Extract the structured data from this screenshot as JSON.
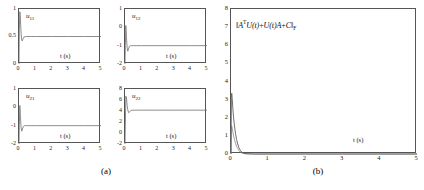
{
  "figure": {
    "captions": [
      {
        "id": "caption-a",
        "text": "(a)"
      },
      {
        "id": "caption-b",
        "text": "(b)"
      }
    ]
  },
  "chart_data": [
    {
      "id": "u11",
      "type": "line",
      "title": "u11",
      "series_label": "u",
      "series_sub": "11",
      "xlabel": "t (s)",
      "ylabel": "",
      "xlim": [
        0,
        5
      ],
      "ylim": [
        0,
        1
      ],
      "xticks": [
        0,
        1,
        2,
        3,
        4,
        5
      ],
      "xticklabels": [
        "0",
        "1",
        "2",
        "3",
        "4",
        "5"
      ],
      "yticks": [
        0,
        0.5,
        1
      ],
      "yticklabels": [
        "0",
        "0.5",
        "1"
      ],
      "grid": false,
      "steady_state": 0.5,
      "x": [
        0,
        0.02,
        0.05,
        0.08,
        0.1,
        0.13,
        0.16,
        0.2,
        0.25,
        0.3,
        0.4,
        0.5,
        0.7,
        1.0,
        2.0,
        3.0,
        4.0,
        5.0
      ],
      "y": [
        0,
        0.62,
        0.95,
        0.88,
        0.72,
        0.55,
        0.44,
        0.42,
        0.46,
        0.49,
        0.5,
        0.5,
        0.5,
        0.5,
        0.5,
        0.5,
        0.5,
        0.5
      ]
    },
    {
      "id": "u12",
      "type": "line",
      "title": "u12",
      "series_label": "u",
      "series_sub": "12",
      "xlabel": "t (s)",
      "ylabel": "",
      "xlim": [
        0,
        5
      ],
      "ylim": [
        -2,
        1
      ],
      "xticks": [
        0,
        1,
        2,
        3,
        4,
        5
      ],
      "xticklabels": [
        "0",
        "1",
        "2",
        "3",
        "4",
        "5"
      ],
      "yticks": [
        -2,
        -1,
        0,
        1
      ],
      "yticklabels": [
        "-2",
        "-1",
        "0",
        "1"
      ],
      "grid": false,
      "steady_state": -1,
      "x": [
        0,
        0.02,
        0.05,
        0.09,
        0.13,
        0.17,
        0.21,
        0.26,
        0.32,
        0.4,
        0.5,
        0.7,
        1.0,
        2.0,
        3.0,
        4.0,
        5.0
      ],
      "y": [
        -2,
        -1.0,
        0.1,
        -0.55,
        -1.12,
        -1.3,
        -1.18,
        -1.05,
        -1.0,
        -1.0,
        -1.0,
        -1.0,
        -1.0,
        -1.0,
        -1.0,
        -1.0,
        -1.0
      ]
    },
    {
      "id": "u21",
      "type": "line",
      "title": "u21",
      "series_label": "u",
      "series_sub": "21",
      "xlabel": "t (s)",
      "ylabel": "",
      "xlim": [
        0,
        5
      ],
      "ylim": [
        -2,
        1
      ],
      "xticks": [
        0,
        1,
        2,
        3,
        4,
        5
      ],
      "xticklabels": [
        "0",
        "1",
        "2",
        "3",
        "4",
        "5"
      ],
      "yticks": [
        -2,
        -1,
        0,
        1
      ],
      "yticklabels": [
        "-2",
        "-1",
        "0",
        "1"
      ],
      "grid": false,
      "steady_state": -1,
      "x": [
        0,
        0.02,
        0.05,
        0.09,
        0.13,
        0.17,
        0.21,
        0.26,
        0.32,
        0.4,
        0.5,
        0.7,
        1.0,
        2.0,
        3.0,
        4.0,
        5.0
      ],
      "y": [
        -2,
        -1.0,
        0.1,
        -0.55,
        -1.12,
        -1.3,
        -1.18,
        -1.05,
        -1.0,
        -1.0,
        -1.0,
        -1.0,
        -1.0,
        -1.0,
        -1.0,
        -1.0,
        -1.0
      ]
    },
    {
      "id": "u22",
      "type": "line",
      "title": "u22",
      "series_label": "u",
      "series_sub": "22",
      "xlabel": "t (s)",
      "ylabel": "",
      "xlim": [
        0,
        5
      ],
      "ylim": [
        -2,
        8
      ],
      "xticks": [
        0,
        1,
        2,
        3,
        4,
        5
      ],
      "xticklabels": [
        "0",
        "1",
        "2",
        "3",
        "4",
        "5"
      ],
      "yticks": [
        -2,
        0,
        2,
        4,
        6,
        8
      ],
      "yticklabels": [
        "-2",
        "0",
        "2",
        "4",
        "6",
        "8"
      ],
      "grid": false,
      "steady_state": 4,
      "x": [
        0,
        0.02,
        0.05,
        0.09,
        0.13,
        0.17,
        0.22,
        0.28,
        0.35,
        0.45,
        0.6,
        0.8,
        1.0,
        2.0,
        3.0,
        4.0,
        5.0
      ],
      "y": [
        -2,
        1.2,
        6.7,
        6.4,
        5.0,
        4.2,
        3.7,
        3.85,
        4.05,
        4.15,
        4.15,
        4.15,
        4.15,
        4.15,
        4.15,
        4.15,
        4.15
      ]
    },
    {
      "id": "residual-norm",
      "type": "line",
      "title": "‖AᵀU(t)+U(t)A+C‖F",
      "norm_label": {
        "prefix": "‖",
        "a": "A",
        "sup": "T",
        "u1": "U",
        "t1": "(t)",
        "plus1": "+",
        "u2": "U",
        "t2": "(t)",
        "a2": "A",
        "plus2": "+",
        "c": "C",
        "suffix": "‖",
        "sub": "F"
      },
      "xlabel": "t (s)",
      "ylabel": "",
      "xlim": [
        0,
        5
      ],
      "ylim": [
        0,
        8
      ],
      "xticks": [
        0,
        1,
        2,
        3,
        4,
        5
      ],
      "xticklabels": [
        "0",
        "1",
        "2",
        "3",
        "4",
        "5"
      ],
      "yticks": [
        0,
        1,
        2,
        3,
        4,
        5,
        6,
        7,
        8
      ],
      "yticklabels": [
        "0",
        "1",
        "2",
        "3",
        "4",
        "5",
        "6",
        "7",
        "8"
      ],
      "grid": false,
      "x": [
        0,
        0.01,
        0.02,
        0.035,
        0.05,
        0.07,
        0.09,
        0.12,
        0.15,
        0.18,
        0.21,
        0.25,
        0.29,
        0.33,
        0.4,
        0.6,
        1.0,
        2.0,
        3.0,
        4.0,
        5.0
      ],
      "y": [
        0.0,
        3.1,
        3.35,
        3.0,
        2.5,
        2.0,
        1.6,
        1.15,
        0.8,
        0.55,
        0.36,
        0.2,
        0.1,
        0.05,
        0.02,
        0.0,
        0.0,
        0.0,
        0.0,
        0.0,
        0.0
      ],
      "y_secondary": [
        0.0,
        1.45,
        1.55,
        1.4,
        1.22,
        1.0,
        0.82,
        0.6,
        0.42,
        0.3,
        0.2,
        0.11,
        0.06,
        0.03,
        0.01,
        0.0,
        0.0,
        0.0,
        0.0,
        0.0,
        0.0
      ]
    }
  ]
}
